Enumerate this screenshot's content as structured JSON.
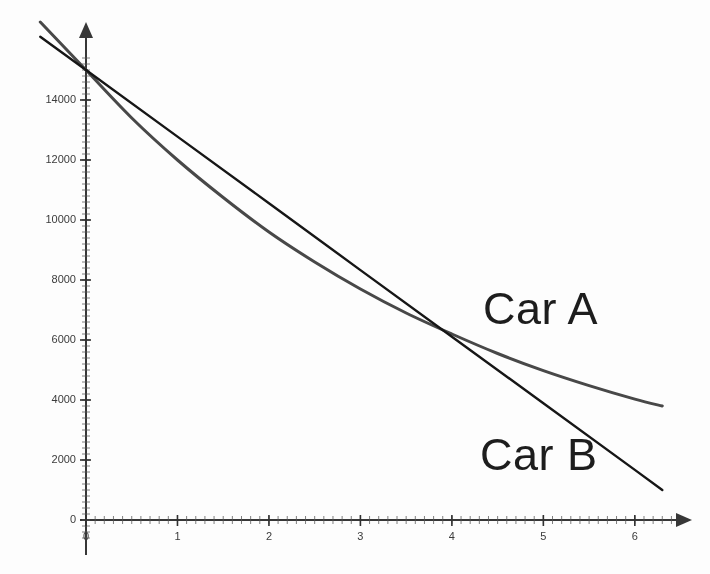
{
  "chart_data": {
    "type": "line",
    "title": "",
    "subtitle": "",
    "xlabel": "",
    "ylabel": "",
    "xlim": [
      -0.55,
      6.4
    ],
    "ylim": [
      -700,
      15600
    ],
    "grid": false,
    "legend_position": "inline-annotation",
    "x_ticks": [
      0,
      1,
      2,
      3,
      4,
      5,
      6
    ],
    "x_tick_labels": [
      "0",
      "1",
      "2",
      "3",
      "4",
      "5",
      "6"
    ],
    "y_ticks": [
      0,
      2000,
      4000,
      6000,
      8000,
      10000,
      12000,
      14000
    ],
    "y_tick_labels": [
      "0",
      "2000",
      "4000",
      "6000",
      "8000",
      "10000",
      "12000",
      "14000"
    ],
    "minor_ticks": true,
    "axis_arrows": true,
    "intersection": {
      "x": 4.1,
      "y": 6100,
      "label": ""
    },
    "series": [
      {
        "name": "Car A",
        "style": "curve",
        "color": "#4a4a4a",
        "line_width": 3.0,
        "description": "exponential depreciation, flattens at high x",
        "x": [
          0,
          0.5,
          1,
          1.5,
          2,
          2.5,
          3,
          3.5,
          4,
          4.5,
          5,
          5.5,
          6,
          6.3
        ],
        "values": [
          15000,
          13400,
          12000,
          10750,
          9600,
          8600,
          7700,
          6900,
          6200,
          5550,
          4980,
          4480,
          4030,
          3800
        ]
      },
      {
        "name": "Car B",
        "style": "line",
        "color": "#1a1a1a",
        "line_width": 2.4,
        "description": "straight-line depreciation, constant slope",
        "x": [
          0,
          1,
          2,
          3,
          4,
          5,
          6,
          6.3
        ],
        "values": [
          15000,
          12780,
          10560,
          8330,
          6110,
          3890,
          1670,
          1000
        ]
      }
    ],
    "annotations": [
      {
        "name": "car-a-label",
        "text": "Car A",
        "x": 4.55,
        "y": 6950
      },
      {
        "name": "car-b-label",
        "text": "Car B",
        "x": 4.5,
        "y": 2400
      }
    ]
  }
}
